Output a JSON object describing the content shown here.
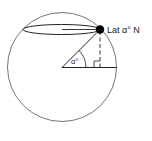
{
  "diagram": {
    "point_label": "Lat α° N",
    "angle_label": "α°",
    "colors": {
      "stroke": "#555555",
      "point": "#000000",
      "background": "#ffffff"
    },
    "elements": [
      {
        "id": "globe",
        "type": "circle",
        "desc": "Earth outline"
      },
      {
        "id": "latitude-circle",
        "type": "ellipse",
        "desc": "Line of latitude seen in perspective"
      },
      {
        "id": "location-point",
        "type": "dot",
        "desc": "Point at latitude alpha north"
      },
      {
        "id": "radius-to-point",
        "type": "line",
        "desc": "From earth centre to the point"
      },
      {
        "id": "equator-radius",
        "type": "line",
        "desc": "Horizontal radius in equatorial plane"
      },
      {
        "id": "vertical-drop",
        "type": "dashed-line",
        "desc": "Perpendicular from point to equatorial plane"
      },
      {
        "id": "right-angle",
        "type": "marker"
      },
      {
        "id": "angle-arc",
        "type": "arc",
        "desc": "Latitude angle alpha at centre"
      }
    ]
  }
}
